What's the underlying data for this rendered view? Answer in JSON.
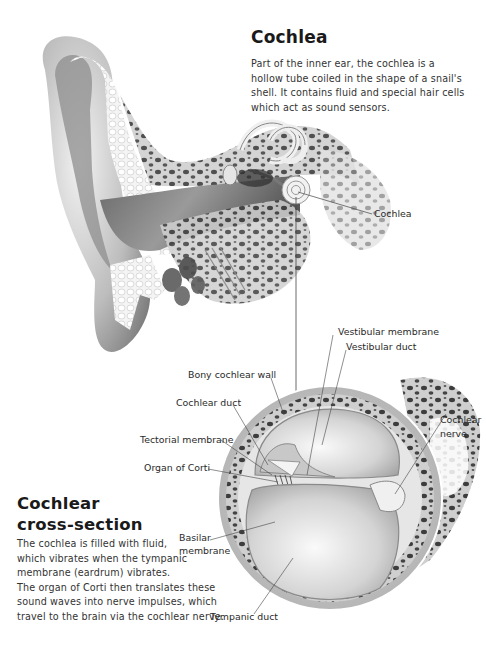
{
  "cochlea": {
    "title": "Cochlea",
    "description_lines": [
      "Part of the inner ear, the cochlea is a",
      "hollow tube coiled in the shape of a snail's",
      "shell. It contains fluid and special hair cells",
      "which act as sound sensors."
    ],
    "callout_label": "Cochlea"
  },
  "cross_section": {
    "title_lines": [
      "Cochlear",
      "cross-section"
    ],
    "description_lines": [
      "The cochlea is filled with fluid,",
      "which vibrates when the tympanic",
      "membrane (eardrum) vibrates.",
      "The organ of Corti then translates these",
      "sound waves into nerve impulses, which",
      "travel to the brain via the cochlear nerve."
    ],
    "labels": {
      "vestibular_membrane": "Vestibular membrane",
      "vestibular_duct": "Vestibular duct",
      "bony_cochlear_wall": "Bony cochlear wall",
      "cochlear_duct": "Cochlear duct",
      "tectorial_membrane": "Tectorial membrane",
      "organ_of_corti": "Organ of Corti",
      "basilar_membrane_1": "Basilar",
      "basilar_membrane_2": "membrane",
      "cochlear_nerve_1": "Cochlear",
      "cochlear_nerve_2": "nerve",
      "tympanic_duct": "Tympanic duct"
    }
  },
  "colors": {
    "background": "#ffffff",
    "text": "#222222",
    "leader_line": "#444444",
    "bone_dark": "#3a3a3a",
    "tissue_light": "#e8e8e8"
  }
}
